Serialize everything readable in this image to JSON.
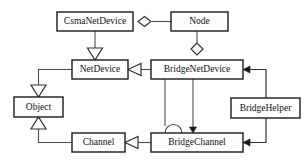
{
  "diagram": {
    "type": "uml-class-diagram",
    "background_color": "#ffffff",
    "box_fill": "#ffffff",
    "box_stroke": "#1a1a1a",
    "edge_color": "#4d4d4d",
    "classes": [
      {
        "id": "csmanetdevice",
        "label": "CsmaNetDevice",
        "x": 57,
        "y": 12,
        "w": 76,
        "h": 19
      },
      {
        "id": "node",
        "label": "Node",
        "x": 171,
        "y": 12,
        "w": 57,
        "h": 19
      },
      {
        "id": "netdevice",
        "label": "NetDevice",
        "x": 72,
        "y": 60,
        "w": 56,
        "h": 19
      },
      {
        "id": "bridgenetdevice",
        "label": "BridgeNetDevice",
        "x": 151,
        "y": 60,
        "w": 92,
        "h": 19
      },
      {
        "id": "object",
        "label": "Object",
        "x": 14,
        "y": 97,
        "w": 49,
        "h": 20
      },
      {
        "id": "bridgehelper",
        "label": "BridgeHelper",
        "x": 231,
        "y": 98,
        "w": 69,
        "h": 20
      },
      {
        "id": "channel",
        "label": "Channel",
        "x": 72,
        "y": 133,
        "w": 53,
        "h": 19
      },
      {
        "id": "bridgechannel",
        "label": "BridgeChannel",
        "x": 151,
        "y": 133,
        "w": 92,
        "h": 19
      }
    ],
    "relationships": [
      {
        "id": "rel-node-csmanetdevice",
        "from": "node",
        "to": "csmanetdevice",
        "kind": "aggregation",
        "marker": "hollow-diamond"
      },
      {
        "id": "rel-node-bridgenetdevice",
        "from": "node",
        "to": "bridgenetdevice",
        "kind": "aggregation",
        "marker": "hollow-diamond"
      },
      {
        "id": "rel-csmanetdevice-netdevice",
        "from": "csmanetdevice",
        "to": "netdevice",
        "kind": "generalization",
        "marker": "hollow-triangle"
      },
      {
        "id": "rel-bridgenetdevice-netdevice",
        "from": "bridgenetdevice",
        "to": "netdevice",
        "kind": "generalization",
        "marker": "hollow-triangle"
      },
      {
        "id": "rel-netdevice-object",
        "from": "netdevice",
        "to": "object",
        "kind": "generalization",
        "marker": "hollow-triangle"
      },
      {
        "id": "rel-channel-object",
        "from": "channel",
        "to": "object",
        "kind": "generalization",
        "marker": "hollow-triangle"
      },
      {
        "id": "rel-bridgechannel-channel",
        "from": "bridgechannel",
        "to": "channel",
        "kind": "generalization",
        "marker": "hollow-triangle"
      },
      {
        "id": "rel-bridgenetdevice-bridgechannel",
        "from": "bridgenetdevice",
        "to": "bridgechannel",
        "kind": "association",
        "marker": "solid-arrow"
      },
      {
        "id": "rel-bridgechannel-self",
        "from": "bridgenetdevice",
        "to": "bridgechannel",
        "kind": "association",
        "marker": "arc-loop"
      },
      {
        "id": "rel-bridgehelper-bridgenetdevice",
        "from": "bridgehelper",
        "to": "bridgenetdevice",
        "kind": "dependency",
        "marker": "solid-arrow"
      },
      {
        "id": "rel-bridgehelper-bridgechannel",
        "from": "bridgehelper",
        "to": "bridgechannel",
        "kind": "dependency",
        "marker": "solid-arrow"
      }
    ]
  }
}
